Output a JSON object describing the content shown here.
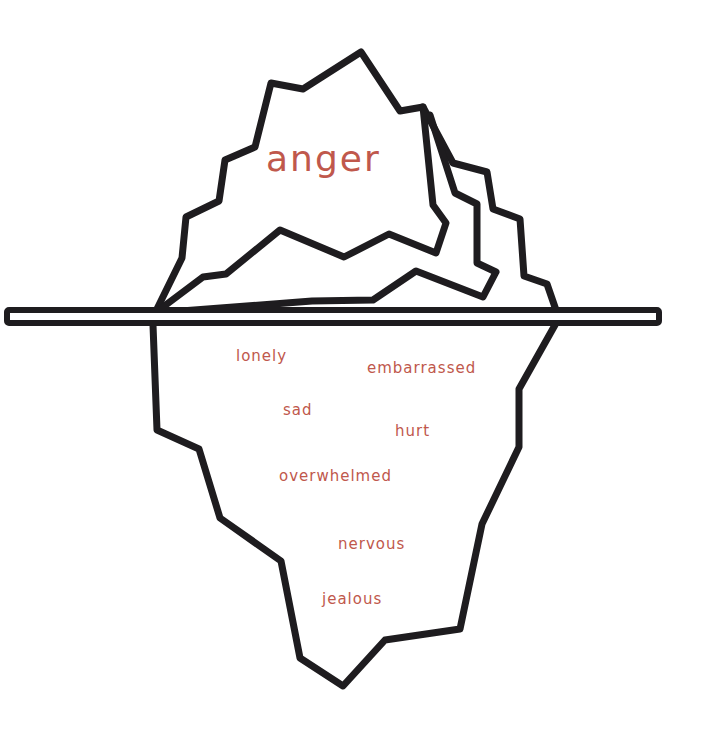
{
  "diagram": {
    "type": "iceberg",
    "title": "",
    "colors": {
      "outline": "#1e1c1f",
      "text": "#c0584c",
      "background": "#ffffff"
    },
    "above_water": {
      "label": "anger"
    },
    "below_water": {
      "labels": [
        "lonely",
        "embarrassed",
        "sad",
        "hurt",
        "overwhelmed",
        "nervous",
        "jealous"
      ]
    }
  }
}
